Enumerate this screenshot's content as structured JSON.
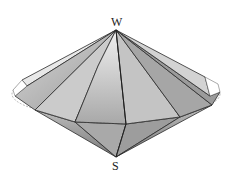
{
  "figure": {
    "labels": {
      "top_apex": "W",
      "bottom_apex": "S"
    },
    "colors": {
      "edge": "#2a2a2a",
      "face_light": "#e2e2e2",
      "face_mid": "#bdbdbd",
      "face_dark": "#8f8f8f",
      "dashed_rim": "#777777"
    }
  }
}
